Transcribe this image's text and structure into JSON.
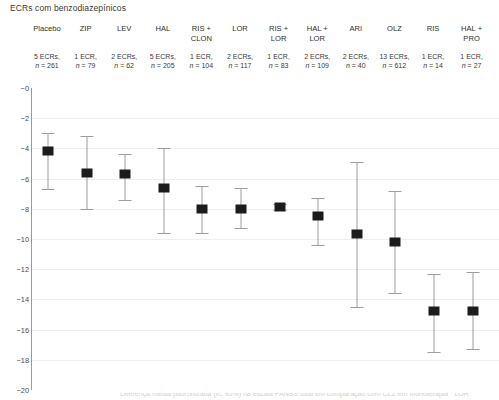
{
  "chart_title": "ECRs com benzodiazepínicos",
  "footer_cut_text": "Diferença média padronizada (IC 95%) na escala PANSS total em comparação com CLZ em monoterapia · LOR",
  "axis": {
    "y_ticks": [
      "−0",
      "−2",
      "−4",
      "−6",
      "−8",
      "−10",
      "−12",
      "−14",
      "−16",
      "−18",
      "−20"
    ],
    "y_tick_values": [
      0,
      -2,
      -4,
      -6,
      -8,
      -10,
      -12,
      -14,
      -16,
      -18,
      -20
    ],
    "ylim": [
      -20,
      0
    ]
  },
  "columns": [
    {
      "name": "Placebo",
      "ecrs": "5 ECRs,",
      "n": "n = 261"
    },
    {
      "name": "ZIP",
      "ecrs": "1 ECR,",
      "n": "n = 79"
    },
    {
      "name": "LEV",
      "ecrs": "2 ECRs,",
      "n": "n = 62"
    },
    {
      "name": "HAL",
      "ecrs": "5 ECRs,",
      "n": "n = 205"
    },
    {
      "name": "RIS +\nCLON",
      "ecrs": "1 ECR,",
      "n": "n = 104"
    },
    {
      "name": "LOR",
      "ecrs": "2 ECRs,",
      "n": "n = 117"
    },
    {
      "name": "RIS +\nLOR",
      "ecrs": "1 ECR,",
      "n": "n = 83"
    },
    {
      "name": "HAL +\nLOR",
      "ecrs": "2 ECRs,",
      "n": "n = 109"
    },
    {
      "name": "ARI",
      "ecrs": "2 ECRs,",
      "n": "n = 40"
    },
    {
      "name": "OLZ",
      "ecrs": "13 ECRs,",
      "n": "n = 612"
    },
    {
      "name": "RIS",
      "ecrs": "1 ECR,",
      "n": "n = 14"
    },
    {
      "name": "HAL +\nPRO",
      "ecrs": "1 ECR,",
      "n": "n = 27"
    }
  ],
  "chart_data": {
    "type": "scatter",
    "title": "ECRs com benzodiazepínicos",
    "xlabel": "",
    "ylabel": "",
    "ylim": [
      -20,
      0
    ],
    "grid": true,
    "legend": "none",
    "categories": [
      "Placebo",
      "ZIP",
      "LEV",
      "HAL",
      "RIS + CLON",
      "LOR",
      "RIS + LOR",
      "HAL + LOR",
      "ARI",
      "OLZ",
      "RIS",
      "HAL + PRO"
    ],
    "values": [
      -4.2,
      -5.6,
      -5.7,
      -6.6,
      -8.0,
      -8.0,
      -7.9,
      -8.5,
      -9.7,
      -10.2,
      -14.8,
      -14.75
    ],
    "ci_low": [
      -6.7,
      -8.0,
      -7.4,
      -9.6,
      -9.6,
      -9.3,
      -8.1,
      -10.4,
      -14.5,
      -13.6,
      -17.5,
      -17.3
    ],
    "ci_high": [
      -3.0,
      -3.2,
      -4.4,
      -4.0,
      -6.5,
      -6.6,
      -7.7,
      -7.3,
      -4.9,
      -6.8,
      -12.3,
      -12.2
    ],
    "n_studies": [
      5,
      1,
      2,
      5,
      1,
      2,
      1,
      2,
      2,
      13,
      1,
      1
    ],
    "n_patients": [
      261,
      79,
      62,
      205,
      104,
      117,
      83,
      109,
      40,
      612,
      14,
      27
    ],
    "marker_color": "#1c1c1c",
    "errorbar_color": "#9d9d9d"
  }
}
